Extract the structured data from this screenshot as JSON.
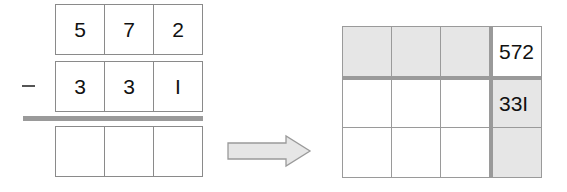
{
  "left_problem": {
    "operator": "−",
    "minuend_digits": [
      "5",
      "7",
      "2"
    ],
    "subtrahend_digits": [
      "3",
      "3",
      "I"
    ],
    "result_digits": [
      "",
      "",
      ""
    ]
  },
  "arrow": {
    "direction": "right",
    "fill": "#e6e6e6",
    "stroke": "#9a9a9a"
  },
  "right_grid": {
    "rows": 3,
    "cols": 4,
    "minuend_label": "572",
    "subtrahend_label": "33I",
    "shaded_color": "#e6e6e6",
    "line_color": "#9a9a9a"
  }
}
